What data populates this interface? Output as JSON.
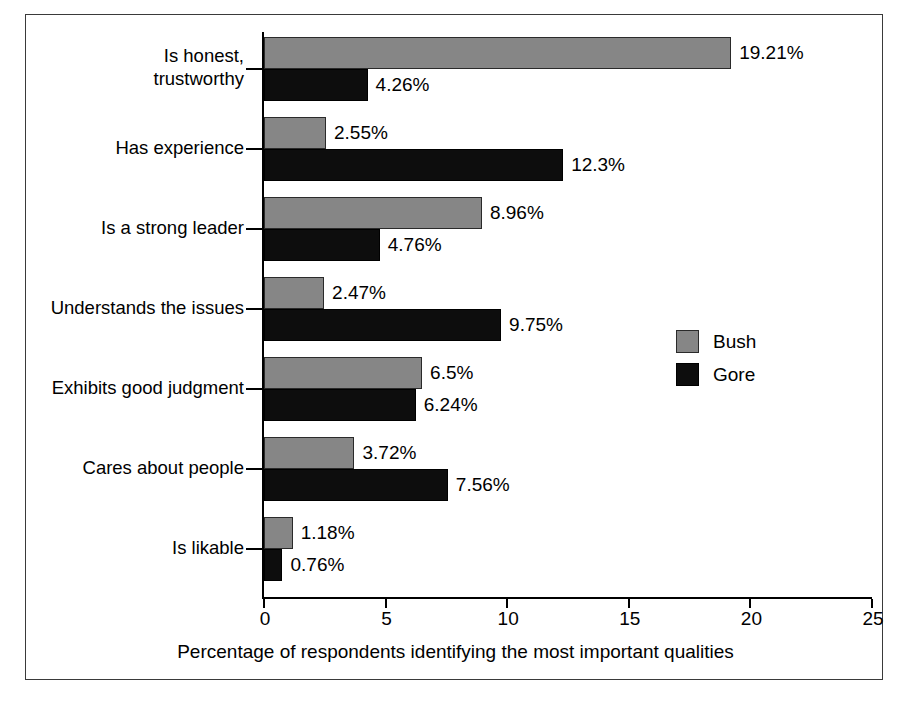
{
  "chart_data": {
    "type": "bar",
    "orientation": "horizontal",
    "title": "",
    "subtitle": "",
    "xlabel": "Percentage of respondents identifying the most important qualities",
    "ylabel": "",
    "xlim": [
      0,
      25
    ],
    "xticks": [
      0,
      5,
      10,
      15,
      20,
      25
    ],
    "xtick_labels": [
      "0",
      "5",
      "10",
      "15",
      "20",
      "25"
    ],
    "grid": false,
    "legend_position": "right-middle",
    "categories": [
      "Is honest,\ntrustworthy",
      "Has experience",
      "Is a strong leader",
      "Understands the issues",
      "Exhibits good judgment",
      "Cares about people",
      "Is likable"
    ],
    "series": [
      {
        "name": "Bush",
        "color": "#868686",
        "values": [
          19.21,
          2.55,
          8.96,
          2.47,
          6.5,
          3.72,
          1.18
        ],
        "value_labels": [
          "19.21%",
          "2.55%",
          "8.96%",
          "2.47%",
          "6.5%",
          "3.72%",
          "1.18%"
        ]
      },
      {
        "name": "Gore",
        "color": "#0d0d0d",
        "values": [
          4.26,
          12.3,
          4.76,
          9.75,
          6.24,
          7.56,
          0.76
        ],
        "value_labels": [
          "4.26%",
          "12.3%",
          "4.76%",
          "9.75%",
          "6.24%",
          "7.56%",
          "0.76%"
        ]
      }
    ]
  },
  "legend": {
    "items": [
      {
        "label": "Bush",
        "color": "#868686"
      },
      {
        "label": "Gore",
        "color": "#0d0d0d"
      }
    ]
  }
}
